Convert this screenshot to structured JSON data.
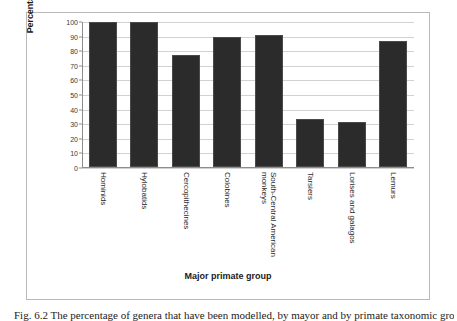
{
  "chart_data": {
    "type": "bar",
    "title": "",
    "xlabel": "Major primate group",
    "ylabel": "Percentage of genera modelled",
    "categories": [
      "Hominids",
      "Hylobatids",
      "Cercopithecines",
      "Colobines",
      "South-Central American monkeys",
      "Tarsiers",
      "Lorises and galagos",
      "Lemurs"
    ],
    "category_lines": [
      [
        "Hominids"
      ],
      [
        "Hylobatids"
      ],
      [
        "Cercopithecines"
      ],
      [
        "Colobines"
      ],
      [
        "South-Central American",
        "monkeys"
      ],
      [
        "Tarsiers"
      ],
      [
        "Lorises and galagos"
      ],
      [
        "Lemurs"
      ]
    ],
    "values": [
      100,
      100,
      77,
      90,
      91,
      33,
      31,
      87
    ],
    "ylim": [
      0,
      100
    ],
    "yticks": [
      100,
      90,
      80,
      70,
      60,
      50,
      40,
      30,
      20,
      10,
      0
    ],
    "grid": true,
    "legend": "none",
    "bar_color": "#2b2b2b",
    "gridline_color": "#d2d2d2",
    "axis_color": "#8d8d8d"
  },
  "caption": {
    "label": "Fig. 6.2",
    "text": "Fig. 6.2  The percentage of genera that have been modelled, by mayor and by primate taxonomic group"
  }
}
